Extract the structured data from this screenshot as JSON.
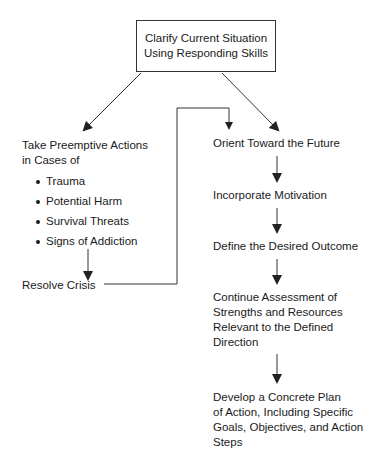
{
  "diagram": {
    "top_box": {
      "lines": [
        "Clarify Current Situation",
        "Using Responding Skills"
      ]
    },
    "left_branch": {
      "heading": [
        "Take Preemptive Actions",
        "in Cases of"
      ],
      "bullets": [
        "Trauma",
        "Potential Harm",
        "Survival Threats",
        "Signs of Addiction"
      ],
      "end": "Resolve Crisis"
    },
    "right_branch": {
      "steps": [
        {
          "lines": [
            "Orient Toward the Future"
          ]
        },
        {
          "lines": [
            "Incorporate Motivation"
          ]
        },
        {
          "lines": [
            "Define the Desired Outcome"
          ]
        },
        {
          "lines": [
            "Continue Assessment of",
            "Strengths and Resources",
            "Relevant to the Defined",
            "Direction"
          ]
        },
        {
          "lines": [
            "Develop a Concrete Plan",
            "of Action, Including Specific",
            "Goals, Objectives, and Action",
            "Steps"
          ]
        }
      ]
    },
    "colors": {
      "line": "#333333",
      "text": "#1a1a1a",
      "background": "#ffffff"
    }
  }
}
